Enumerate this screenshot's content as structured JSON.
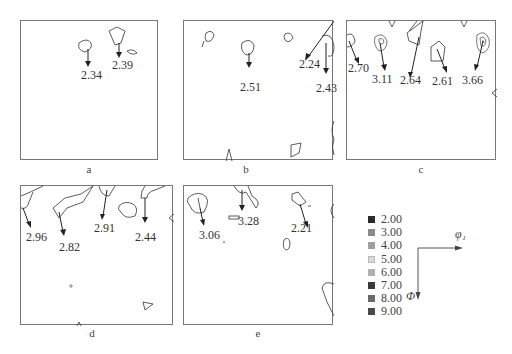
{
  "figure": {
    "panels": [
      {
        "id": "a",
        "caption": "a",
        "values": [
          "2.34",
          "2.39"
        ]
      },
      {
        "id": "b",
        "caption": "b",
        "values": [
          "2.51",
          "2.24",
          "2.43"
        ]
      },
      {
        "id": "c",
        "caption": "c",
        "values": [
          "2.70",
          "3.11",
          "2.64",
          "2.61",
          "3.66"
        ]
      },
      {
        "id": "d",
        "caption": "d",
        "values": [
          "2.96",
          "2.82",
          "2.91",
          "2.44"
        ]
      },
      {
        "id": "e",
        "caption": "e",
        "values": [
          "3.06",
          "3.28",
          "2.21"
        ]
      }
    ],
    "legend": {
      "items": [
        {
          "label": "2.00",
          "color": "#2a2a2a"
        },
        {
          "label": "3.00",
          "color": "#8a8a8a"
        },
        {
          "label": "4.00",
          "color": "#a0a0a0"
        },
        {
          "label": "5.00",
          "color": "#d8d8d8"
        },
        {
          "label": "6.00",
          "color": "#b0b0b0"
        },
        {
          "label": "7.00",
          "color": "#3a3a3a"
        },
        {
          "label": "8.00",
          "color": "#6a6a6a"
        },
        {
          "label": "9.00",
          "color": "#4a4a4a"
        }
      ]
    },
    "axes": {
      "horizontal": "φ₁",
      "vertical": "Φ"
    }
  }
}
